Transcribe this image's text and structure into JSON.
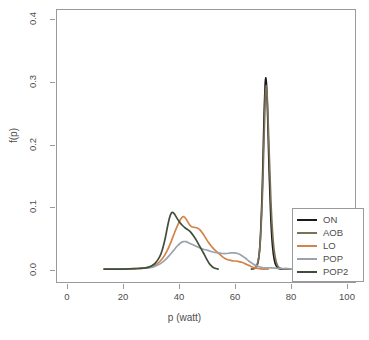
{
  "chart_data": {
    "type": "line",
    "title": "",
    "xlabel": "p (watt)",
    "ylabel": "f(p)",
    "xlim": [
      0,
      100
    ],
    "ylim": [
      0.0,
      0.4
    ],
    "xticks": [
      0,
      20,
      40,
      60,
      80,
      100
    ],
    "yticks": [
      "0.0",
      "0.1",
      "0.2",
      "0.3",
      "0.4"
    ],
    "grid": false,
    "legend_position": "bottom-right",
    "series": [
      {
        "name": "ON",
        "color": "#1a1a1a",
        "points": [
          [
            66.0,
            0.0
          ],
          [
            67.0,
            0.001
          ],
          [
            67.8,
            0.004
          ],
          [
            68.4,
            0.012
          ],
          [
            68.9,
            0.03
          ],
          [
            69.3,
            0.06
          ],
          [
            69.7,
            0.105
          ],
          [
            70.0,
            0.15
          ],
          [
            70.3,
            0.205
          ],
          [
            70.6,
            0.258
          ],
          [
            70.9,
            0.295
          ],
          [
            71.1,
            0.307
          ],
          [
            71.4,
            0.296
          ],
          [
            71.7,
            0.262
          ],
          [
            72.0,
            0.215
          ],
          [
            72.3,
            0.165
          ],
          [
            72.7,
            0.112
          ],
          [
            73.1,
            0.068
          ],
          [
            73.6,
            0.035
          ],
          [
            74.2,
            0.015
          ],
          [
            74.9,
            0.005
          ],
          [
            75.8,
            0.001
          ],
          [
            77.0,
            0.0
          ],
          [
            80.0,
            0.0
          ]
        ]
      },
      {
        "name": "AOB",
        "color": "#7a7258",
        "points": [
          [
            66.2,
            0.0
          ],
          [
            67.2,
            0.002
          ],
          [
            68.0,
            0.007
          ],
          [
            68.6,
            0.018
          ],
          [
            69.1,
            0.04
          ],
          [
            69.5,
            0.072
          ],
          [
            69.9,
            0.115
          ],
          [
            70.2,
            0.158
          ],
          [
            70.5,
            0.208
          ],
          [
            70.8,
            0.252
          ],
          [
            71.0,
            0.282
          ],
          [
            71.3,
            0.295
          ],
          [
            71.6,
            0.282
          ],
          [
            71.9,
            0.25
          ],
          [
            72.2,
            0.208
          ],
          [
            72.6,
            0.158
          ],
          [
            73.0,
            0.108
          ],
          [
            73.5,
            0.064
          ],
          [
            74.1,
            0.032
          ],
          [
            74.8,
            0.013
          ],
          [
            75.6,
            0.004
          ],
          [
            76.6,
            0.001
          ],
          [
            78.0,
            0.0
          ],
          [
            80.0,
            0.0
          ]
        ]
      },
      {
        "name": "LO",
        "color": "#d4834a",
        "points": [
          [
            13.0,
            0.0
          ],
          [
            20.0,
            0.0
          ],
          [
            25.0,
            0.001
          ],
          [
            28.0,
            0.002
          ],
          [
            30.0,
            0.004
          ],
          [
            32.0,
            0.008
          ],
          [
            34.0,
            0.017
          ],
          [
            35.5,
            0.028
          ],
          [
            37.0,
            0.043
          ],
          [
            38.3,
            0.058
          ],
          [
            39.5,
            0.071
          ],
          [
            40.5,
            0.08
          ],
          [
            41.3,
            0.084
          ],
          [
            42.0,
            0.083
          ],
          [
            42.8,
            0.078
          ],
          [
            43.6,
            0.072
          ],
          [
            44.5,
            0.068
          ],
          [
            45.5,
            0.067
          ],
          [
            46.5,
            0.066
          ],
          [
            47.5,
            0.063
          ],
          [
            48.5,
            0.057
          ],
          [
            49.5,
            0.05
          ],
          [
            50.5,
            0.043
          ],
          [
            51.5,
            0.037
          ],
          [
            52.5,
            0.032
          ],
          [
            53.5,
            0.028
          ],
          [
            54.5,
            0.024
          ],
          [
            55.5,
            0.02
          ],
          [
            56.5,
            0.017
          ],
          [
            57.5,
            0.015
          ],
          [
            58.5,
            0.014
          ],
          [
            59.5,
            0.013
          ],
          [
            60.5,
            0.013
          ],
          [
            61.5,
            0.012
          ],
          [
            62.5,
            0.011
          ],
          [
            63.5,
            0.009
          ],
          [
            64.5,
            0.007
          ],
          [
            65.5,
            0.005
          ],
          [
            66.5,
            0.003
          ],
          [
            67.5,
            0.002
          ],
          [
            68.5,
            0.001
          ],
          [
            70.0,
            0.0
          ],
          [
            72.0,
            0.0
          ]
        ]
      },
      {
        "name": "POP",
        "color": "#9aa3ad",
        "points": [
          [
            13.0,
            0.0
          ],
          [
            20.0,
            0.0
          ],
          [
            26.0,
            0.001
          ],
          [
            29.0,
            0.002
          ],
          [
            31.0,
            0.004
          ],
          [
            33.0,
            0.008
          ],
          [
            35.0,
            0.015
          ],
          [
            36.5,
            0.022
          ],
          [
            38.0,
            0.03
          ],
          [
            39.3,
            0.037
          ],
          [
            40.5,
            0.042
          ],
          [
            41.5,
            0.044
          ],
          [
            42.5,
            0.044
          ],
          [
            43.5,
            0.042
          ],
          [
            44.5,
            0.04
          ],
          [
            45.5,
            0.038
          ],
          [
            46.5,
            0.036
          ],
          [
            47.5,
            0.034
          ],
          [
            48.5,
            0.032
          ],
          [
            49.5,
            0.031
          ],
          [
            51.0,
            0.029
          ],
          [
            52.5,
            0.027
          ],
          [
            54.0,
            0.026
          ],
          [
            55.5,
            0.025
          ],
          [
            57.0,
            0.025
          ],
          [
            58.5,
            0.026
          ],
          [
            60.0,
            0.026
          ],
          [
            61.0,
            0.025
          ],
          [
            62.0,
            0.023
          ],
          [
            63.0,
            0.02
          ],
          [
            64.0,
            0.017
          ],
          [
            65.0,
            0.013
          ],
          [
            66.0,
            0.01
          ],
          [
            67.0,
            0.007
          ],
          [
            68.0,
            0.005
          ],
          [
            69.5,
            0.003
          ],
          [
            71.0,
            0.002
          ],
          [
            73.0,
            0.002
          ],
          [
            76.0,
            0.001
          ],
          [
            79.0,
            0.001
          ],
          [
            82.0,
            0.0
          ]
        ]
      },
      {
        "name": "POP2",
        "color": "#3f4f3c",
        "points": [
          [
            13.0,
            0.0
          ],
          [
            20.0,
            0.0
          ],
          [
            25.0,
            0.001
          ],
          [
            28.0,
            0.002
          ],
          [
            30.0,
            0.005
          ],
          [
            31.5,
            0.01
          ],
          [
            33.0,
            0.02
          ],
          [
            34.0,
            0.032
          ],
          [
            35.0,
            0.05
          ],
          [
            35.8,
            0.068
          ],
          [
            36.5,
            0.082
          ],
          [
            37.2,
            0.09
          ],
          [
            37.8,
            0.091
          ],
          [
            38.5,
            0.087
          ],
          [
            39.3,
            0.081
          ],
          [
            40.2,
            0.075
          ],
          [
            41.2,
            0.07
          ],
          [
            42.2,
            0.066
          ],
          [
            43.2,
            0.063
          ],
          [
            44.2,
            0.059
          ],
          [
            45.2,
            0.053
          ],
          [
            46.2,
            0.046
          ],
          [
            47.2,
            0.038
          ],
          [
            48.2,
            0.03
          ],
          [
            49.2,
            0.022
          ],
          [
            50.0,
            0.015
          ],
          [
            50.8,
            0.009
          ],
          [
            51.6,
            0.005
          ],
          [
            52.4,
            0.002
          ],
          [
            53.2,
            0.001
          ],
          [
            54.0,
            0.0
          ]
        ]
      }
    ],
    "legend": [
      {
        "label": "ON",
        "color": "#1a1a1a"
      },
      {
        "label": "AOB",
        "color": "#7a7258"
      },
      {
        "label": "LO",
        "color": "#d4834a"
      },
      {
        "label": "POP",
        "color": "#9aa3ad"
      },
      {
        "label": "POP2",
        "color": "#3f4f3c"
      }
    ]
  }
}
